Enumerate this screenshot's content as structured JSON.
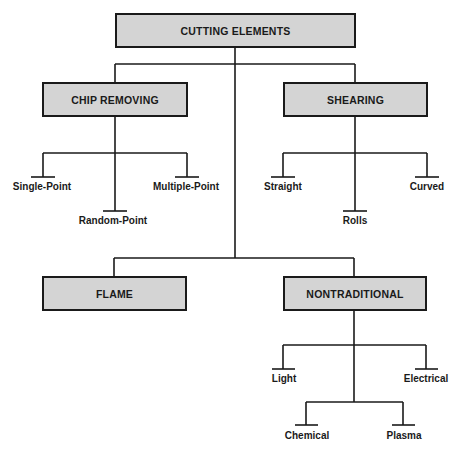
{
  "root": {
    "label": "CUTTING ELEMENTS"
  },
  "categories": [
    {
      "label": "CHIP REMOVING",
      "children": [
        "Single-Point",
        "Random-Point",
        "Multiple-Point"
      ]
    },
    {
      "label": "SHEARING",
      "children": [
        "Straight",
        "Rolls",
        "Curved"
      ]
    },
    {
      "label": "FLAME",
      "children": []
    },
    {
      "label": "NONTRADITIONAL",
      "children": [
        "Light",
        "Electrical",
        "Chemical",
        "Plasma"
      ]
    }
  ],
  "colors": {
    "box_fill": "#d4d4d4",
    "line": "#1a1a1a"
  }
}
